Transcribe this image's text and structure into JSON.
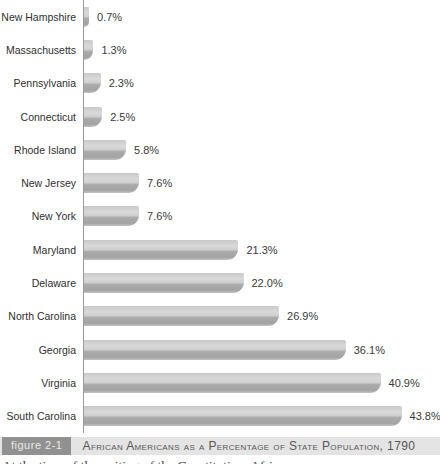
{
  "chart_data": {
    "type": "bar",
    "orientation": "horizontal",
    "title": "African Americans as a Percentage of State Population, 1790",
    "xlabel": "",
    "ylabel": "",
    "xlim": [
      0,
      45
    ],
    "grid": false,
    "legend": null,
    "categories": [
      "New Hampshire",
      "Massachusetts",
      "Pennsylvania",
      "Connecticut",
      "Rhode Island",
      "New Jersey",
      "New York",
      "Maryland",
      "Delaware",
      "North Carolina",
      "Georgia",
      "Virginia",
      "South Carolina"
    ],
    "values": [
      0.7,
      1.3,
      2.3,
      2.5,
      5.8,
      7.6,
      7.6,
      21.3,
      22.0,
      26.9,
      36.1,
      40.9,
      43.8
    ],
    "value_labels": [
      "0.7%",
      "1.3%",
      "2.3%",
      "2.5%",
      "5.8%",
      "7.6%",
      "7.6%",
      "21.3%",
      "22.0%",
      "26.9%",
      "36.1%",
      "40.9%",
      "43.8%"
    ],
    "bar_colors": {
      "top": "#d9d9d9",
      "middle": "#cfcfcf",
      "bottom_band": "#a3a3a3",
      "bottom_edge": "#c2c2c2"
    },
    "axis_color": "#9a9a9a"
  },
  "figure": {
    "label": "figure 2-1",
    "caption": "African Americans as a Percentage of State Population, 1790"
  },
  "body_text": "At the time of the writing of the Constitution, African",
  "colors": {
    "caption_strip_bg": "#e4e4e4",
    "figure_badge_bg": "#919191",
    "figure_badge_text": "#e9e9e9",
    "caption_text": "#565656",
    "label_text": "#2f2f2f"
  }
}
